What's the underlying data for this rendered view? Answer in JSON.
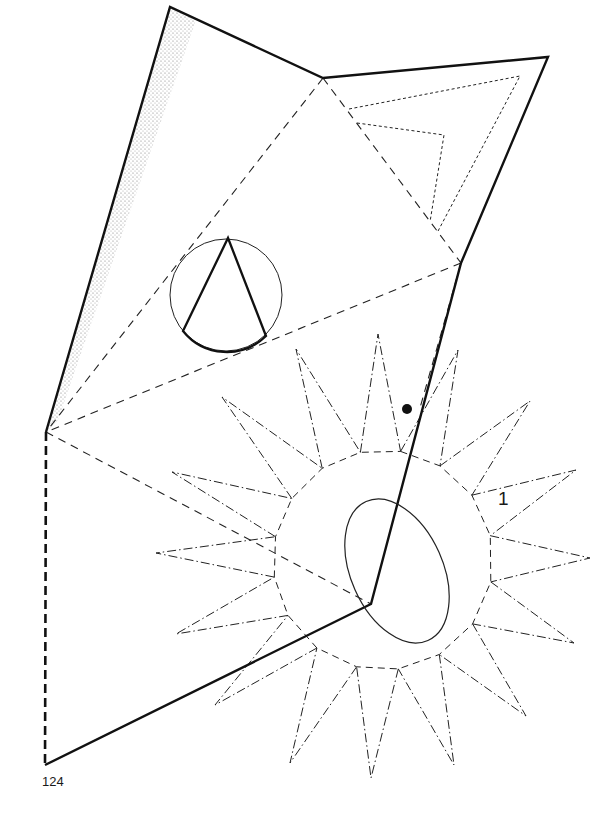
{
  "page": {
    "number": "124"
  },
  "diagram": {
    "part_label": "1",
    "line_color": "#111111",
    "stipple_color": "#777777",
    "background": "#ffffff",
    "outline": [
      [
        170,
        7
      ],
      [
        323,
        78
      ],
      [
        548,
        57
      ],
      [
        461,
        263
      ],
      [
        371,
        604
      ],
      [
        45,
        765
      ],
      [
        46,
        432
      ]
    ],
    "fold_lines": [
      [
        [
          323,
          78
        ],
        [
          46,
          432
        ]
      ],
      [
        [
          323,
          78
        ],
        [
          461,
          263
        ]
      ],
      [
        [
          461,
          263
        ],
        [
          46,
          432
        ]
      ],
      [
        [
          46,
          432
        ],
        [
          371,
          604
        ]
      ],
      [
        [
          461,
          263
        ],
        [
          420,
          410
        ]
      ]
    ],
    "sun": {
      "center": [
        383,
        560
      ],
      "inner_radius": 110,
      "ray_tips": [
        [
          378,
          334
        ],
        [
          458,
          350
        ],
        [
          530,
          401
        ],
        [
          576,
          470
        ],
        [
          590,
          558
        ],
        [
          574,
          643
        ],
        [
          526,
          716
        ],
        [
          454,
          765
        ],
        [
          371,
          778
        ],
        [
          290,
          763
        ],
        [
          215,
          705
        ],
        [
          176,
          634
        ],
        [
          156,
          553
        ],
        [
          172,
          472
        ],
        [
          222,
          397
        ],
        [
          296,
          349
        ]
      ]
    },
    "dot": [
      407,
      409
    ],
    "circle_inset": {
      "center": [
        226,
        295
      ],
      "r": 56
    },
    "ellipse": {
      "center": [
        396,
        572
      ],
      "rx": 46,
      "ry": 76,
      "rotate": -22
    }
  }
}
